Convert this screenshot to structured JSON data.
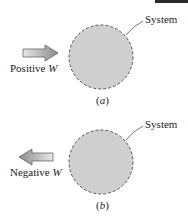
{
  "panels": [
    {
      "id": "a",
      "caption": "(a)",
      "caption_letter": "a",
      "system_label": "System",
      "work_label": "Positive ",
      "work_symbol": "W",
      "arrow_direction": "right"
    },
    {
      "id": "b",
      "caption": "(b)",
      "caption_letter": "b",
      "system_label": "System",
      "work_label": "Negative ",
      "work_symbol": "W",
      "arrow_direction": "left"
    }
  ],
  "colors": {
    "system_fill": "#cfcfcf",
    "system_outline": "#555555",
    "arrow_fill": "#a8a8a8"
  }
}
